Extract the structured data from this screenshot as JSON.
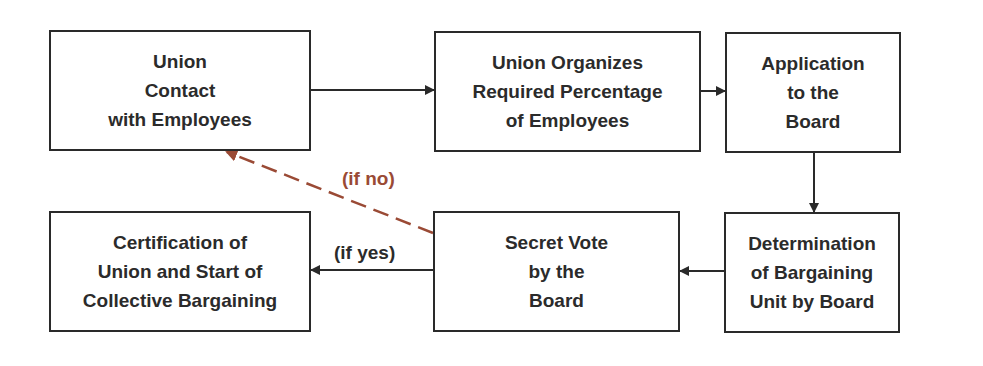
{
  "diagram": {
    "nodes": [
      {
        "id": "union-contact",
        "text": "Union\nContact\nwith Employees"
      },
      {
        "id": "union-organizes",
        "text": "Union Organizes\nRequired Percentage\nof Employees"
      },
      {
        "id": "application",
        "text": "Application\nto the\nBoard"
      },
      {
        "id": "determination",
        "text": "Determination\nof Bargaining\nUnit by Board"
      },
      {
        "id": "secret-vote",
        "text": "Secret Vote\nby the\nBoard"
      },
      {
        "id": "certification",
        "text": "Certification of\nUnion and Start of\nCollective Bargaining"
      }
    ],
    "edges": [
      {
        "from": "union-contact",
        "to": "union-organizes",
        "label": ""
      },
      {
        "from": "union-organizes",
        "to": "application",
        "label": ""
      },
      {
        "from": "application",
        "to": "determination",
        "label": ""
      },
      {
        "from": "determination",
        "to": "secret-vote",
        "label": ""
      },
      {
        "from": "secret-vote",
        "to": "certification",
        "label": "(if yes)"
      },
      {
        "from": "secret-vote",
        "to": "union-contact",
        "label": "(if no)",
        "style": "dashed"
      }
    ],
    "labels": {
      "if_no": "(if no)",
      "if_yes": "(if yes)"
    },
    "colors": {
      "line": "#2a2a2a",
      "no_path": "#9a4a35"
    }
  }
}
